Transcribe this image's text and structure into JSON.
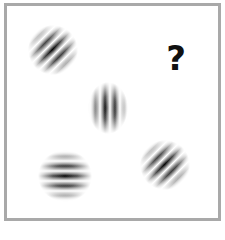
{
  "figure": {
    "border_color": "#a9a9a9",
    "background": "#ffffff",
    "patches": [
      {
        "id": "patch-1",
        "position": "top-left",
        "orientation_deg": 45,
        "cx": 53,
        "cy": 50,
        "w": 50,
        "h": 50
      },
      {
        "id": "patch-2",
        "position": "center",
        "orientation_deg": 90,
        "cx": 108,
        "cy": 108,
        "w": 40,
        "h": 52
      },
      {
        "id": "patch-3",
        "position": "bottom-left",
        "orientation_deg": 0,
        "cx": 65,
        "cy": 176,
        "w": 54,
        "h": 52
      },
      {
        "id": "patch-4",
        "position": "bottom-right",
        "orientation_deg": 45,
        "cx": 165,
        "cy": 165,
        "w": 50,
        "h": 50
      }
    ],
    "missing_marker": "?"
  }
}
